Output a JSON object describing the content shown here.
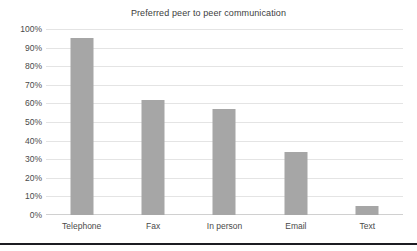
{
  "chart_data": {
    "type": "bar",
    "title": "Preferred peer to peer communication",
    "xlabel": "",
    "ylabel": "",
    "categories": [
      "Telephone",
      "Fax",
      "In person",
      "Email",
      "Text"
    ],
    "values": [
      95,
      62,
      57,
      34,
      5
    ],
    "ylim": [
      0,
      100
    ],
    "ytick_labels": [
      "100%",
      "90%",
      "80%",
      "70%",
      "60%",
      "50%",
      "40%",
      "30%",
      "20%",
      "10%",
      "0%"
    ],
    "ytick_values": [
      100,
      90,
      80,
      70,
      60,
      50,
      40,
      30,
      20,
      10,
      0
    ],
    "grid": true,
    "legend": false,
    "bar_color": "#a6a6a6",
    "gridline_color": "#e4e4e4",
    "text_color": "#4a4a4a"
  }
}
